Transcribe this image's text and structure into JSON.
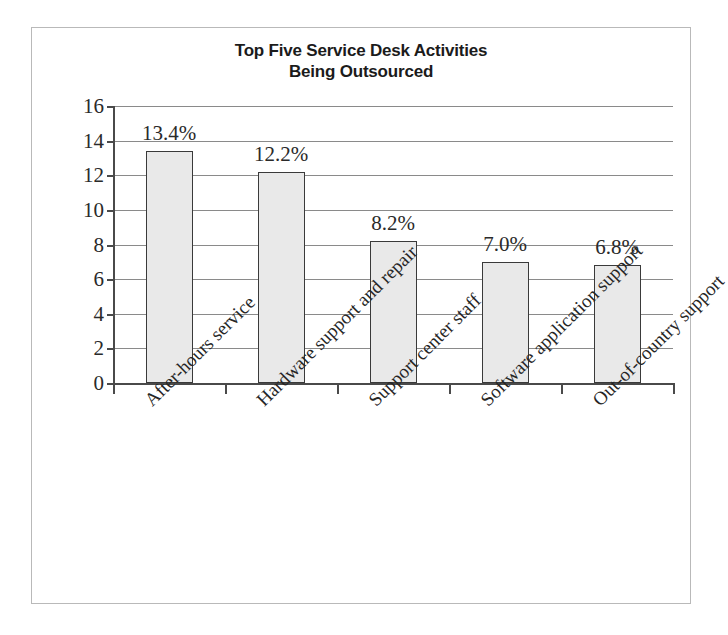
{
  "chart_data": {
    "type": "bar",
    "title": "Top Five Service Desk Activities Being Outsourced",
    "title_line1": "Top Five Service Desk Activities",
    "title_line2": "Being Outsourced",
    "xlabel": "",
    "ylabel": "",
    "ylim": [
      0,
      16
    ],
    "ytick_step": 2,
    "yticks": [
      16,
      14,
      12,
      10,
      8,
      6,
      4,
      2,
      0
    ],
    "grid": true,
    "legend": false,
    "categories": [
      "After-hours service",
      "Hardware support and repair",
      "Support center staff",
      "Software application support",
      "Out-of-country support"
    ],
    "values": [
      13.4,
      12.2,
      8.2,
      7.0,
      6.8
    ],
    "data_labels": [
      "13.4%",
      "12.2%",
      "8.2%",
      "7.0%",
      "6.8%"
    ],
    "bar_fill_color": "#e9e9e9",
    "bar_border_color": "#3a3a3a",
    "axis_color": "#4a4a4a",
    "gridline_color": "#8a8a8a",
    "frame_color": "#b9b9b9",
    "background_color": "#ffffff"
  },
  "caption": {
    "remnant_text": ""
  }
}
